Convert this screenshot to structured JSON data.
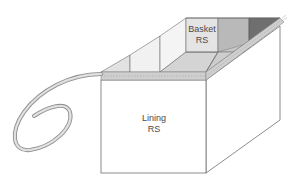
{
  "diagram": {
    "type": "sewing-illustration",
    "labels": {
      "basket": {
        "line1": "Basket",
        "line2": "RS"
      },
      "lining": {
        "line1": "Lining",
        "line2": "RS"
      }
    },
    "colors": {
      "outline": "#6e6e6e",
      "face": "#ffffff",
      "panel_light": "#e6e6e6",
      "panel_lighter": "#efefef",
      "panel_mid": "#d6d6d6",
      "panel_gray": "#b4b4b4",
      "panel_dark": "#6e6e6e",
      "binding": "#c8c8c8",
      "binding_edge": "#8a8a8a",
      "text": "#4a4a4a"
    }
  }
}
